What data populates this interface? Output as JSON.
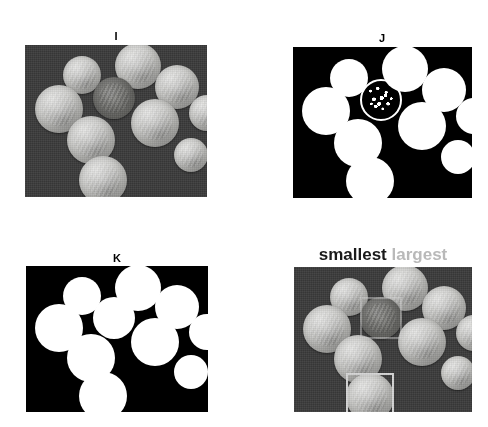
{
  "figure": {
    "width": 488,
    "height": 427,
    "panel_count": 4,
    "colors": {
      "photo_background": "#3a3a3a",
      "mask_background": "#000000",
      "mask_foreground": "#ffffff",
      "page_background": "#ffffff",
      "smallest_label": "#1a1a1a",
      "largest_label": "#b9b9b9",
      "bbox_stroke": "#d5d5d5"
    }
  },
  "panels": [
    {
      "id": "I",
      "label": "I",
      "kind": "grayscale-photo",
      "caption_position": "top-center",
      "frame": {
        "x": 25,
        "y": 45,
        "w": 182,
        "h": 152
      },
      "label_pos": {
        "x": 116,
        "y": 31
      },
      "coins": [
        {
          "cx": 57,
          "cy": 30,
          "r": 19,
          "tone": "light"
        },
        {
          "cx": 113,
          "cy": 21,
          "r": 23,
          "tone": "light"
        },
        {
          "cx": 34,
          "cy": 64,
          "r": 24,
          "tone": "light"
        },
        {
          "cx": 89,
          "cy": 53,
          "r": 21,
          "tone": "dark"
        },
        {
          "cx": 152,
          "cy": 42,
          "r": 22,
          "tone": "light"
        },
        {
          "cx": 182,
          "cy": 68,
          "r": 18,
          "tone": "light"
        },
        {
          "cx": 130,
          "cy": 78,
          "r": 24,
          "tone": "light"
        },
        {
          "cx": 66,
          "cy": 95,
          "r": 24,
          "tone": "light"
        },
        {
          "cx": 166,
          "cy": 110,
          "r": 17,
          "tone": "light"
        },
        {
          "cx": 78,
          "cy": 135,
          "r": 24,
          "tone": "light"
        }
      ]
    },
    {
      "id": "J",
      "label": "J",
      "kind": "binary-mask-noisy",
      "caption_position": "top-center",
      "frame": {
        "x": 293,
        "y": 47,
        "w": 179,
        "h": 151
      },
      "label_pos": {
        "x": 382,
        "y": 33
      },
      "coins": [
        {
          "cx": 56,
          "cy": 31,
          "r": 19,
          "fill": "solid"
        },
        {
          "cx": 112,
          "cy": 22,
          "r": 23,
          "fill": "solid"
        },
        {
          "cx": 33,
          "cy": 64,
          "r": 24,
          "fill": "solid"
        },
        {
          "cx": 88,
          "cy": 53,
          "r": 21,
          "fill": "ring-noisy"
        },
        {
          "cx": 151,
          "cy": 43,
          "r": 22,
          "fill": "solid"
        },
        {
          "cx": 181,
          "cy": 69,
          "r": 18,
          "fill": "solid"
        },
        {
          "cx": 129,
          "cy": 79,
          "r": 24,
          "fill": "solid"
        },
        {
          "cx": 65,
          "cy": 96,
          "r": 24,
          "fill": "solid"
        },
        {
          "cx": 165,
          "cy": 110,
          "r": 17,
          "fill": "solid"
        },
        {
          "cx": 77,
          "cy": 134,
          "r": 24,
          "fill": "solid"
        }
      ]
    },
    {
      "id": "K",
      "label": "K",
      "kind": "binary-mask-clean",
      "caption_position": "top-center",
      "frame": {
        "x": 26,
        "y": 266,
        "w": 182,
        "h": 146
      },
      "label_pos": {
        "x": 117,
        "y": 253
      },
      "coins": [
        {
          "cx": 56,
          "cy": 30,
          "r": 19,
          "fill": "solid"
        },
        {
          "cx": 112,
          "cy": 22,
          "r": 23,
          "fill": "solid"
        },
        {
          "cx": 33,
          "cy": 62,
          "r": 24,
          "fill": "solid"
        },
        {
          "cx": 88,
          "cy": 52,
          "r": 21,
          "fill": "solid"
        },
        {
          "cx": 151,
          "cy": 41,
          "r": 22,
          "fill": "solid"
        },
        {
          "cx": 181,
          "cy": 66,
          "r": 18,
          "fill": "solid"
        },
        {
          "cx": 129,
          "cy": 76,
          "r": 24,
          "fill": "solid"
        },
        {
          "cx": 65,
          "cy": 92,
          "r": 24,
          "fill": "solid"
        },
        {
          "cx": 165,
          "cy": 106,
          "r": 17,
          "fill": "solid"
        },
        {
          "cx": 77,
          "cy": 130,
          "r": 24,
          "fill": "solid"
        }
      ]
    },
    {
      "id": "L",
      "label": "",
      "kind": "annotated-photo",
      "caption_position": "top-center",
      "caption_parts": [
        {
          "text": "smallest",
          "color_role": "smallest_label"
        },
        {
          "text": "largest",
          "color_role": "largest_label"
        }
      ],
      "frame": {
        "x": 294,
        "y": 267,
        "w": 178,
        "h": 145
      },
      "label_pos": {
        "x": 383,
        "y": 252
      },
      "coins": [
        {
          "cx": 55,
          "cy": 30,
          "r": 19,
          "tone": "light"
        },
        {
          "cx": 111,
          "cy": 21,
          "r": 23,
          "tone": "light"
        },
        {
          "cx": 33,
          "cy": 62,
          "r": 24,
          "tone": "light"
        },
        {
          "cx": 87,
          "cy": 51,
          "r": 21,
          "tone": "dark"
        },
        {
          "cx": 150,
          "cy": 41,
          "r": 22,
          "tone": "light"
        },
        {
          "cx": 180,
          "cy": 66,
          "r": 18,
          "tone": "light"
        },
        {
          "cx": 128,
          "cy": 75,
          "r": 24,
          "tone": "light"
        },
        {
          "cx": 64,
          "cy": 92,
          "r": 24,
          "tone": "light"
        },
        {
          "cx": 164,
          "cy": 106,
          "r": 17,
          "tone": "light"
        },
        {
          "cx": 76,
          "cy": 130,
          "r": 24,
          "tone": "light"
        }
      ],
      "annotations": [
        {
          "role": "smallest",
          "x": 66,
          "y": 30,
          "w": 42,
          "h": 42
        },
        {
          "role": "largest",
          "x": 52,
          "y": 106,
          "w": 48,
          "h": 48
        }
      ]
    }
  ]
}
